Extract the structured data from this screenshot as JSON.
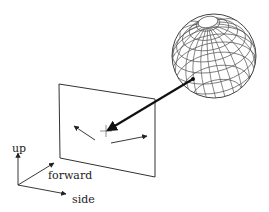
{
  "diagram": {
    "type": "camera-viewing-sphere",
    "labels": {
      "up": "up",
      "forward": "forward",
      "side": "side"
    },
    "colors": {
      "line": "#333333",
      "sphere_grid": "#555555",
      "view_arrow": "#111111",
      "background": "#ffffff"
    },
    "elements": [
      "wireframe-sphere",
      "image-plane",
      "view-direction-arrow",
      "plane-motion-arrows",
      "coordinate-axes"
    ]
  }
}
